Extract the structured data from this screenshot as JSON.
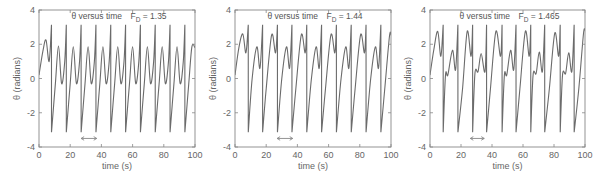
{
  "chart_data": [
    {
      "type": "line",
      "title": "θ versus time   F_D = 1.35",
      "title_main": "θ versus time",
      "title_param_symbol": "F",
      "title_param_sub": "D",
      "title_param_value": "= 1.35",
      "xlabel": "time (s)",
      "ylabel": "θ (radians)",
      "xlim": [
        0,
        100
      ],
      "ylim": [
        -4,
        4
      ],
      "xticks": [
        0,
        20,
        40,
        60,
        80,
        100
      ],
      "yticks": [
        -4,
        -2,
        0,
        2,
        4
      ],
      "grid": false,
      "legend": null,
      "annotation": "double-headed arrow spanning t≈27–37 s at θ≈-3.5 (one drive period)",
      "arrow": {
        "x0": 27,
        "x1": 37,
        "y": -3.5
      },
      "series": [
        {
          "name": "theta",
          "description": "periodic motion with period ≈ 9.4 s; per cycle a wrap-around spike from +3.14 to -3.14 plus a smaller hump to ≈1.9",
          "keypoints_t": [
            0,
            2.5,
            4.5,
            6.5,
            8.0,
            8.01,
            10.5,
            12.5,
            14.5,
            16.5,
            17.5,
            17.51,
            20,
            22,
            24,
            26,
            27,
            27.01,
            29.5,
            31.5,
            33.5,
            35.5,
            36.5,
            36.51,
            39,
            41,
            43,
            45,
            46,
            46.01,
            48.5,
            50.5,
            52.5,
            54.5,
            55.5,
            55.51,
            58,
            60,
            62,
            64,
            65,
            65.01,
            67.5,
            69.5,
            71.5,
            73.5,
            74.5,
            74.51,
            77,
            79,
            81,
            83,
            84,
            84.01,
            86.5,
            88.5,
            90.5,
            92.5,
            93.5,
            93.51,
            96,
            98,
            100
          ],
          "keypoints_theta": [
            0.2,
            1.6,
            2.25,
            1.0,
            3.14,
            -3.14,
            -0.3,
            1.9,
            -0.3,
            1.0,
            3.14,
            -3.14,
            -0.3,
            1.85,
            -0.3,
            1.0,
            3.14,
            -3.14,
            -0.3,
            1.85,
            -0.3,
            1.0,
            3.14,
            -3.14,
            -0.3,
            1.85,
            -0.3,
            1.0,
            3.14,
            -3.14,
            -0.3,
            1.85,
            -0.3,
            1.0,
            3.14,
            -3.14,
            -0.3,
            1.85,
            -0.3,
            1.0,
            3.14,
            -3.14,
            -0.3,
            1.85,
            -0.3,
            1.0,
            3.14,
            -3.14,
            -0.3,
            1.85,
            -0.3,
            1.0,
            3.14,
            -3.14,
            -0.3,
            1.85,
            -0.3,
            1.0,
            3.14,
            -3.14,
            -0.3,
            1.85,
            1.8
          ]
        }
      ]
    },
    {
      "type": "line",
      "title": "θ versus time   F_D = 1.44",
      "title_main": "θ versus time",
      "title_param_symbol": "F",
      "title_param_sub": "D",
      "title_param_value": "= 1.44",
      "xlabel": "time (s)",
      "ylabel": "θ (radians)",
      "xlim": [
        0,
        100
      ],
      "ylim": [
        -4,
        4
      ],
      "xticks": [
        0,
        20,
        40,
        60,
        80,
        100
      ],
      "yticks": [
        -4,
        -2,
        0,
        2,
        4
      ],
      "grid": false,
      "legend": null,
      "annotation": "double-headed arrow spanning t≈27–37 s at θ≈-3.5",
      "arrow": {
        "x0": 27,
        "x1": 37,
        "y": -3.5
      },
      "series": [
        {
          "name": "theta",
          "description": "period-doubled motion (≈18.8 s): alternating large humps ≈2.55 and small humps ≈1.85 between wrap-around spikes",
          "keypoints_t": [
            0,
            2.5,
            5,
            7,
            8.5,
            8.51,
            11,
            14,
            16,
            17.7,
            17.71,
            20,
            23.5,
            26,
            27.2,
            27.21,
            30,
            33,
            35,
            36.5,
            36.51,
            39,
            42.5,
            45,
            46,
            46.01,
            49,
            52,
            54,
            55.5,
            55.51,
            58,
            61.5,
            64,
            65,
            65.01,
            68,
            71,
            73,
            74.5,
            74.51,
            77,
            80.5,
            83,
            84,
            84.01,
            87,
            90,
            92,
            93.5,
            93.51,
            96,
            99,
            100
          ],
          "keypoints_theta": [
            0.2,
            1.8,
            2.6,
            1.5,
            3.14,
            -3.14,
            0.0,
            1.85,
            0.6,
            3.14,
            -3.14,
            -0.6,
            2.55,
            1.5,
            3.14,
            -3.14,
            0.0,
            1.85,
            0.6,
            3.14,
            -3.14,
            -0.6,
            2.55,
            1.5,
            3.14,
            -3.14,
            0.0,
            1.85,
            0.6,
            3.14,
            -3.14,
            -0.6,
            2.55,
            1.5,
            3.14,
            -3.14,
            0.0,
            1.85,
            0.6,
            3.14,
            -3.14,
            -0.6,
            2.55,
            1.5,
            3.14,
            -3.14,
            0.0,
            1.85,
            0.6,
            3.14,
            -3.14,
            -0.6,
            2.45,
            2.55
          ]
        }
      ]
    },
    {
      "type": "line",
      "title": "θ versus time   F_D = 1.465",
      "title_main": "θ versus time",
      "title_param_symbol": "F",
      "title_param_sub": "D",
      "title_param_value": "= 1.465",
      "xlabel": "time (s)",
      "ylabel": "θ (radians)",
      "xlim": [
        0,
        100
      ],
      "ylim": [
        -4,
        4
      ],
      "xticks": [
        0,
        20,
        40,
        60,
        80,
        100
      ],
      "yticks": [
        -4,
        -2,
        0,
        2,
        4
      ],
      "grid": false,
      "legend": null,
      "annotation": "double-headed arrow spanning t≈26–35 s at θ≈-3.5",
      "arrow": {
        "x0": 26,
        "x1": 35,
        "y": -3.5
      },
      "series": [
        {
          "name": "theta",
          "description": "period-four motion (≈37.6 s): humps of ≈2.75, ≈1.65, ≈2.75, ≈1.4 between wrap-around spikes",
          "keypoints_t": [
            0,
            2.5,
            5,
            7,
            8.5,
            8.51,
            10,
            11.5,
            14.5,
            16.5,
            18,
            18.01,
            21,
            24,
            26.5,
            27.5,
            27.51,
            29,
            31,
            33,
            35.5,
            36.5,
            36.51,
            39,
            42.5,
            45.5,
            46.5,
            46.51,
            48,
            49.5,
            52,
            54,
            55.5,
            55.51,
            58,
            61.5,
            64,
            65,
            65.01,
            66.5,
            68.5,
            70.5,
            72.5,
            74,
            74.01,
            77,
            80.5,
            83,
            84,
            84.01,
            85.5,
            87.5,
            89.5,
            91.5,
            93,
            93.01,
            96,
            99,
            100
          ],
          "keypoints_theta": [
            0.2,
            1.7,
            2.75,
            1.3,
            3.14,
            -3.14,
            0.2,
            0.2,
            1.65,
            0.5,
            3.14,
            -3.14,
            -0.6,
            2.75,
            1.3,
            3.14,
            -3.14,
            0.3,
            0.4,
            1.45,
            0.4,
            3.14,
            -3.14,
            -0.6,
            2.75,
            1.3,
            3.14,
            -3.14,
            0.2,
            0.2,
            1.65,
            0.5,
            3.14,
            -3.14,
            -0.6,
            2.75,
            1.3,
            3.14,
            -3.14,
            0.2,
            0.3,
            1.55,
            0.4,
            3.14,
            -3.14,
            -0.6,
            2.65,
            1.3,
            3.14,
            -3.14,
            0.2,
            0.3,
            1.5,
            0.4,
            3.14,
            -3.14,
            -0.6,
            2.6,
            2.8
          ]
        }
      ]
    }
  ],
  "layout": {
    "panels": [
      {
        "left": 39,
        "right": 195,
        "top": 10,
        "bottom": 147
      },
      {
        "left": 235,
        "right": 391,
        "top": 10,
        "bottom": 147
      },
      {
        "left": 430,
        "right": 585,
        "top": 10,
        "bottom": 147
      }
    ],
    "colors": {
      "curve": "#6b6b6b",
      "axis": "#888888",
      "text": "#666666"
    }
  }
}
